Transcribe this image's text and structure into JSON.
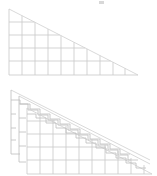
{
  "figure": {
    "top_label": "",
    "panels": [
      {
        "name": "grid-triangle",
        "description": "Right triangle subdivided by a square grid",
        "apex": [
          9,
          9
        ],
        "right_corner": [
          138,
          75
        ],
        "origin": [
          9,
          75
        ],
        "columns": 10,
        "rows": 5,
        "line_color": "#c8c8c8"
      },
      {
        "name": "stacked-staircase-triangle",
        "description": "Three offset layers of grid triangles approximated by staircases",
        "layers": 3,
        "layer_offset": [
          8,
          6
        ],
        "line_color": "#bdbdbd"
      }
    ]
  }
}
